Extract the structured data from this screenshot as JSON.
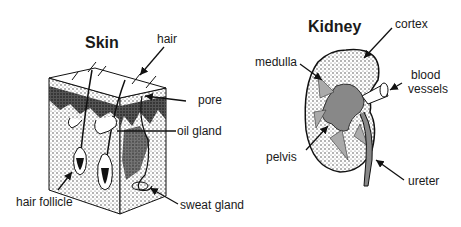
{
  "skin": {
    "title": "Skin",
    "labels": {
      "hair": "hair",
      "pore": "pore",
      "oil_gland": "oil gland",
      "hair_follicle": "hair follicle",
      "sweat_gland": "sweat gland"
    }
  },
  "kidney": {
    "title": "Kidney",
    "labels": {
      "cortex": "cortex",
      "medulla": "medulla",
      "blood_vessels_line1": "blood",
      "blood_vessels_line2": "vessels",
      "pelvis": "pelvis",
      "ureter": "ureter"
    }
  }
}
